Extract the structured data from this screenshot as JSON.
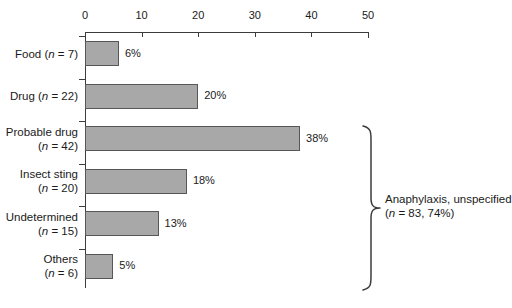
{
  "chart_data": {
    "type": "bar",
    "orientation": "horizontal",
    "title": "",
    "xlabel": "",
    "ylabel": "",
    "xlim": [
      0,
      50
    ],
    "xticks": [
      0,
      10,
      20,
      30,
      40,
      50
    ],
    "xtick_labels": [
      "0",
      "10",
      "20",
      "30",
      "40",
      "50"
    ],
    "grid": false,
    "legend": null,
    "bar_color": "#a8a8a8",
    "bar_edge_color": "#575757",
    "categories": [
      "Food (n = 7)",
      "Drug (n = 22)",
      "Probable drug (n = 42)",
      "Insect sting (n = 20)",
      "Undetermined (n = 15)",
      "Others (n = 6)"
    ],
    "values": [
      6,
      20,
      38,
      18,
      13,
      5
    ],
    "value_labels": [
      "6%",
      "20%",
      "38%",
      "18%",
      "13%",
      "5%"
    ],
    "annotations": [
      {
        "text": "Anaphylaxis, unspecified (n = 83, 74%)",
        "covers": [
          "Probable drug (n = 42)",
          "Insect sting (n = 20)",
          "Undetermined (n = 15)",
          "Others (n = 6)"
        ],
        "marker": "curly-brace"
      }
    ]
  },
  "axis": {
    "ticks": [
      {
        "label": "0",
        "value": 0
      },
      {
        "label": "10",
        "value": 10
      },
      {
        "label": "20",
        "value": 20
      },
      {
        "label": "30",
        "value": 30
      },
      {
        "label": "40",
        "value": 40
      },
      {
        "label": "50",
        "value": 50
      }
    ]
  },
  "rows": [
    {
      "name_line1": "Food (",
      "n_italic": "n",
      "name_line2": " = 7)",
      "label_html_lines": [
        "Food (n = 7)"
      ],
      "value": 6,
      "value_label": "6%"
    },
    {
      "label_html_lines": [
        "Drug (n = 22)"
      ],
      "value": 20,
      "value_label": "20%"
    },
    {
      "label_html_lines": [
        "Probable drug",
        "(n = 42)"
      ],
      "value": 38,
      "value_label": "38%"
    },
    {
      "label_html_lines": [
        "Insect sting",
        "(n = 20)"
      ],
      "value": 18,
      "value_label": "18%"
    },
    {
      "label_html_lines": [
        "Undetermined",
        "(n = 15)"
      ],
      "value": 13,
      "value_label": "13%"
    },
    {
      "label_html_lines": [
        "Others",
        "(n = 6)"
      ],
      "value": 5,
      "value_label": "5%"
    }
  ],
  "brace_annotation": {
    "line1": "Anaphylaxis, unspecified",
    "line2": "(n = 83, 74%)"
  }
}
